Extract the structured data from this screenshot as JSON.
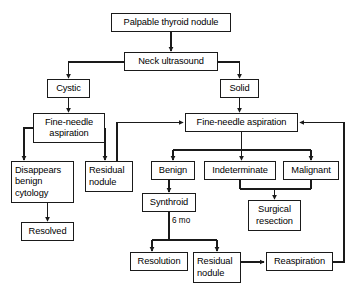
{
  "diagram": {
    "type": "flowchart",
    "stroke_color": "#1a1a1a",
    "background_color": "#ffffff",
    "nodes": [
      {
        "id": "palpable",
        "label": "Palpable thyroid nodule",
        "x": 111,
        "y": 13,
        "w": 120,
        "h": 19
      },
      {
        "id": "neck_us",
        "label": "Neck ultrasound",
        "x": 124,
        "y": 52,
        "w": 94,
        "h": 19
      },
      {
        "id": "cystic",
        "label": "Cystic",
        "x": 47,
        "y": 79,
        "w": 43,
        "h": 19
      },
      {
        "id": "solid",
        "label": "Solid",
        "x": 220,
        "y": 79,
        "w": 39,
        "h": 19
      },
      {
        "id": "fna_left",
        "label": "Fine-needle\naspiration",
        "x": 33,
        "y": 113,
        "w": 72,
        "h": 30
      },
      {
        "id": "fna_right",
        "label": "Fine-needle aspiration",
        "x": 185,
        "y": 113,
        "w": 113,
        "h": 19
      },
      {
        "id": "disappears",
        "label": "Disappears\nbenign\ncytology",
        "x": 11,
        "y": 161,
        "w": 63,
        "h": 42
      },
      {
        "id": "residual_left",
        "label": "Residual\nnodule",
        "x": 85,
        "y": 161,
        "w": 48,
        "h": 31
      },
      {
        "id": "benign",
        "label": "Benign",
        "x": 151,
        "y": 161,
        "w": 44,
        "h": 19
      },
      {
        "id": "indeterminate",
        "label": "Indeterminate",
        "x": 204,
        "y": 161,
        "w": 72,
        "h": 19
      },
      {
        "id": "malignant",
        "label": "Malignant",
        "x": 283,
        "y": 161,
        "w": 56,
        "h": 19
      },
      {
        "id": "resolved",
        "label": "Resolved",
        "x": 21,
        "y": 222,
        "w": 53,
        "h": 19
      },
      {
        "id": "synthroid",
        "label": "Synthroid",
        "x": 142,
        "y": 193,
        "w": 54,
        "h": 19
      },
      {
        "id": "surgical",
        "label": "Surgical\nresection",
        "x": 248,
        "y": 200,
        "w": 53,
        "h": 31
      },
      {
        "id": "resolution",
        "label": "Resolution",
        "x": 130,
        "y": 252,
        "w": 58,
        "h": 19
      },
      {
        "id": "residual_bot",
        "label": "Residual\nnodule",
        "x": 193,
        "y": 252,
        "w": 48,
        "h": 31
      },
      {
        "id": "reaspiration",
        "label": "Reaspiration",
        "x": 266,
        "y": 252,
        "w": 67,
        "h": 19
      }
    ],
    "edge_labels": [
      {
        "id": "six_months",
        "text": "6 mo",
        "x": 172,
        "y": 219
      }
    ],
    "edges": [
      {
        "from": "palpable",
        "to": "neck_us"
      },
      {
        "from": "neck_us",
        "to": "cystic"
      },
      {
        "from": "neck_us",
        "to": "solid"
      },
      {
        "from": "cystic",
        "to": "fna_left"
      },
      {
        "from": "solid",
        "to": "fna_right"
      },
      {
        "from": "fna_left",
        "to": "disappears"
      },
      {
        "from": "fna_left",
        "to": "residual_left"
      },
      {
        "from": "residual_left",
        "to": "fna_right"
      },
      {
        "from": "disappears",
        "to": "resolved"
      },
      {
        "from": "fna_right",
        "to": "benign"
      },
      {
        "from": "fna_right",
        "to": "indeterminate"
      },
      {
        "from": "fna_right",
        "to": "malignant"
      },
      {
        "from": "benign",
        "to": "synthroid"
      },
      {
        "from": "synthroid",
        "to": "resolution",
        "label": "6 mo"
      },
      {
        "from": "synthroid",
        "to": "residual_bot",
        "label": "6 mo"
      },
      {
        "from": "indeterminate",
        "to": "surgical"
      },
      {
        "from": "malignant",
        "to": "surgical"
      },
      {
        "from": "residual_bot",
        "to": "reaspiration"
      },
      {
        "from": "reaspiration",
        "to": "fna_right"
      }
    ]
  }
}
